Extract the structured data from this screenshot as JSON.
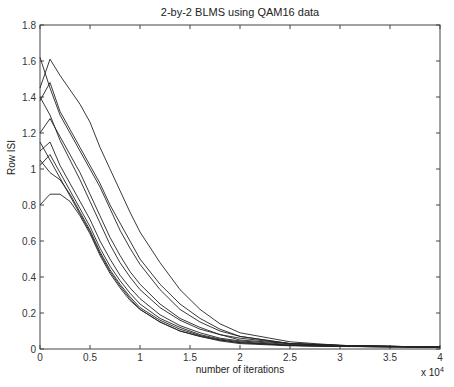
{
  "chart_data": {
    "type": "line",
    "title": "2-by-2 BLMS using QAM16 data",
    "xlabel": "number of iterations",
    "ylabel": "Row ISI",
    "x_scale_label": "x 10",
    "x_scale_exponent": "4",
    "xlim": [
      0,
      4
    ],
    "ylim": [
      0,
      1.8
    ],
    "xticks": [
      "0",
      "0.5",
      "1",
      "1.5",
      "2",
      "2.5",
      "3",
      "3.5",
      "4"
    ],
    "yticks": [
      "0",
      "0.2",
      "0.4",
      "0.6",
      "0.8",
      "1",
      "1.2",
      "1.4",
      "1.6",
      "1.8"
    ],
    "grid": false,
    "legend": null,
    "x": [
      0,
      0.1,
      0.2,
      0.3,
      0.4,
      0.5,
      0.6,
      0.7,
      0.8,
      0.9,
      1.0,
      1.2,
      1.4,
      1.6,
      1.8,
      2.0,
      2.5,
      3.0,
      3.5,
      4.0
    ],
    "series": [
      {
        "name": "run 1",
        "values": [
          1.45,
          1.61,
          1.52,
          1.44,
          1.36,
          1.26,
          1.12,
          1.0,
          0.88,
          0.76,
          0.65,
          0.48,
          0.33,
          0.22,
          0.14,
          0.09,
          0.04,
          0.02,
          0.015,
          0.01
        ]
      },
      {
        "name": "run 2",
        "values": [
          1.62,
          1.45,
          1.3,
          1.2,
          1.1,
          1.0,
          0.9,
          0.78,
          0.66,
          0.56,
          0.47,
          0.33,
          0.22,
          0.15,
          0.1,
          0.07,
          0.03,
          0.02,
          0.015,
          0.01
        ]
      },
      {
        "name": "run 3",
        "values": [
          1.38,
          1.48,
          1.32,
          1.22,
          1.12,
          1.02,
          0.92,
          0.8,
          0.7,
          0.6,
          0.5,
          0.36,
          0.25,
          0.17,
          0.11,
          0.07,
          0.03,
          0.02,
          0.015,
          0.01
        ]
      },
      {
        "name": "run 4",
        "values": [
          1.2,
          1.28,
          1.18,
          1.08,
          0.98,
          0.86,
          0.74,
          0.62,
          0.52,
          0.43,
          0.36,
          0.25,
          0.17,
          0.12,
          0.08,
          0.06,
          0.03,
          0.02,
          0.015,
          0.01
        ]
      },
      {
        "name": "run 5",
        "values": [
          1.4,
          1.3,
          1.16,
          1.05,
          0.94,
          0.82,
          0.7,
          0.58,
          0.48,
          0.4,
          0.33,
          0.23,
          0.16,
          0.11,
          0.08,
          0.05,
          0.03,
          0.02,
          0.015,
          0.01
        ]
      },
      {
        "name": "run 6",
        "values": [
          1.1,
          1.15,
          1.02,
          0.92,
          0.82,
          0.72,
          0.6,
          0.5,
          0.41,
          0.34,
          0.28,
          0.19,
          0.13,
          0.09,
          0.06,
          0.045,
          0.025,
          0.015,
          0.012,
          0.01
        ]
      },
      {
        "name": "run 7",
        "values": [
          1.02,
          1.08,
          0.98,
          0.88,
          0.78,
          0.68,
          0.56,
          0.46,
          0.38,
          0.31,
          0.25,
          0.17,
          0.12,
          0.08,
          0.055,
          0.04,
          0.02,
          0.015,
          0.012,
          0.01
        ]
      },
      {
        "name": "run 8",
        "values": [
          1.05,
          0.98,
          0.94,
          0.86,
          0.76,
          0.66,
          0.54,
          0.44,
          0.36,
          0.29,
          0.23,
          0.16,
          0.11,
          0.075,
          0.05,
          0.035,
          0.02,
          0.015,
          0.012,
          0.01
        ]
      },
      {
        "name": "run 9",
        "values": [
          0.8,
          0.86,
          0.86,
          0.82,
          0.74,
          0.64,
          0.52,
          0.42,
          0.34,
          0.27,
          0.22,
          0.15,
          0.1,
          0.07,
          0.05,
          0.035,
          0.02,
          0.015,
          0.012,
          0.01
        ]
      },
      {
        "name": "run 10",
        "values": [
          1.15,
          1.05,
          0.95,
          0.85,
          0.75,
          0.65,
          0.53,
          0.43,
          0.35,
          0.28,
          0.22,
          0.15,
          0.1,
          0.07,
          0.045,
          0.03,
          0.018,
          0.014,
          0.012,
          0.01
        ]
      }
    ]
  }
}
